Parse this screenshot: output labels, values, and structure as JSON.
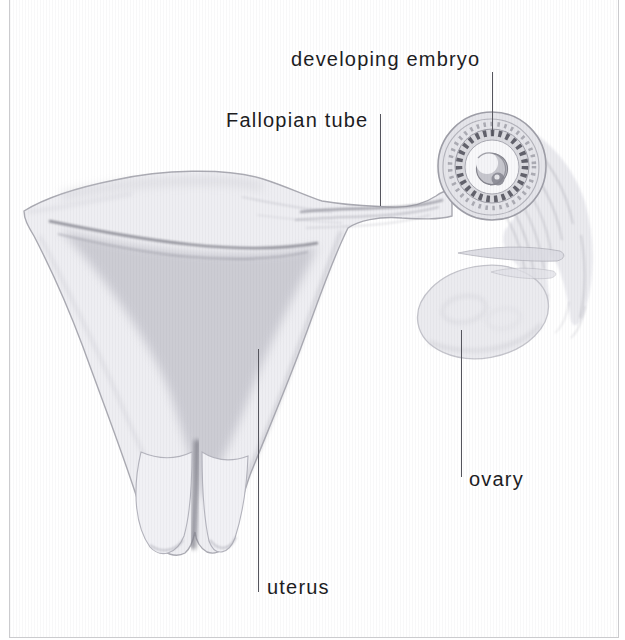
{
  "labels": {
    "developing_embryo": "developing embryo",
    "fallopian_tube": "Fallopian tube",
    "ovary": "ovary",
    "uterus": "uterus"
  },
  "colors": {
    "background": "#ffffff",
    "label_ink": "#1d1d1f",
    "pointer_line": "#55555d",
    "frame_border": "#cbcbce",
    "sketch_light": "#eeeef2",
    "sketch_mid": "#c0c0c8",
    "sketch_dark": "#5b5b64"
  }
}
